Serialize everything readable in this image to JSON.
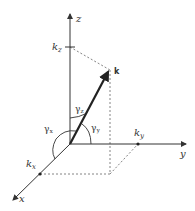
{
  "diagram": {
    "axes": {
      "x": "x",
      "y": "y",
      "z": "z"
    },
    "vector_label": "k",
    "components": {
      "kx": "k",
      "kx_sub": "x",
      "ky": "k",
      "ky_sub": "y",
      "kz": "k",
      "kz_sub": "z"
    },
    "angles": {
      "gx": "γ",
      "gx_sub": "x",
      "gy": "γ",
      "gy_sub": "y",
      "gz": "γ",
      "gz_sub": "z"
    },
    "colors": {
      "line": "#333333",
      "dashed": "#666666"
    }
  }
}
